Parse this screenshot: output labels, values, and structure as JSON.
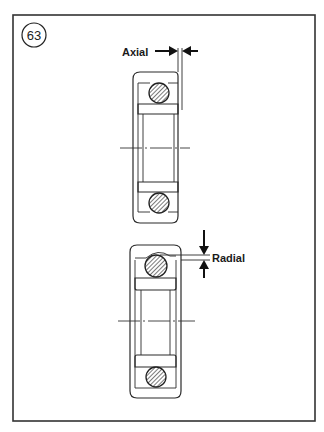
{
  "figure": {
    "number": "63",
    "labels": {
      "axial": "Axial",
      "radial": "Radial"
    }
  },
  "diagram": {
    "type": "technical-illustration",
    "panels": [
      {
        "name": "axial-clearance-bearing",
        "label": "Axial",
        "arrows": [
          "right-pointing",
          "left-pointing"
        ]
      },
      {
        "name": "radial-clearance-bearing",
        "label": "Radial",
        "arrows": [
          "down-pointing",
          "up-pointing"
        ]
      }
    ]
  },
  "colors": {
    "line": "#2a2a2a",
    "background": "#ffffff"
  }
}
